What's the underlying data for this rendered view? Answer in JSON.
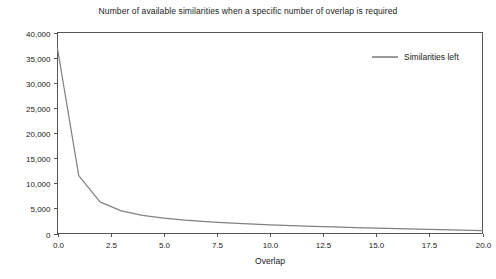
{
  "chart_data": {
    "type": "line",
    "title": "Number of available similarities when a specific number of overlap is required",
    "xlabel": "Overlap",
    "ylabel": "",
    "xlim": [
      0,
      20
    ],
    "ylim": [
      0,
      40000
    ],
    "grid": false,
    "legend_position": "top-right",
    "line_color": "#808080",
    "x": [
      0,
      1,
      2,
      3,
      4,
      5,
      6,
      7,
      8,
      9,
      10,
      11,
      12,
      13,
      14,
      15,
      16,
      17,
      18,
      19,
      20
    ],
    "series": [
      {
        "name": "Similarities left",
        "values": [
          36800,
          11500,
          6300,
          4500,
          3600,
          3050,
          2650,
          2350,
          2100,
          1900,
          1720,
          1570,
          1430,
          1300,
          1180,
          1060,
          960,
          860,
          760,
          660,
          560
        ]
      }
    ],
    "xticks": [
      0,
      2.5,
      5,
      7.5,
      10,
      12.5,
      15,
      17.5,
      20
    ],
    "xticklabels": [
      "0.0",
      "2.5",
      "5.0",
      "7.5",
      "10.0",
      "12.5",
      "15.0",
      "17.5",
      "20.0"
    ],
    "yticks": [
      0,
      5000,
      10000,
      15000,
      20000,
      25000,
      30000,
      35000,
      40000
    ],
    "yticklabels": [
      "0",
      "5,000",
      "10,000",
      "15,000",
      "20,000",
      "25,000",
      "30,000",
      "35,000",
      "40,000"
    ]
  },
  "legend": {
    "entries": [
      {
        "label": "Similarities left"
      }
    ]
  }
}
